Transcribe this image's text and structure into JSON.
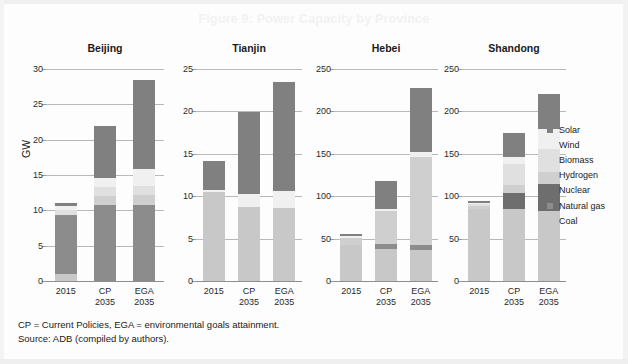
{
  "figure": {
    "title": "Figure 9: Power Capacity by Province",
    "title_color": "#f2f2f2",
    "y_axis_label": "GW"
  },
  "footnote": {
    "line1": "CP = Current Policies, EGA = environmental goals attainment.",
    "line2": "Source: ADB (compiled by authors)."
  },
  "legend": {
    "position": "right",
    "items": [
      {
        "label": "Solar",
        "color": "#808080"
      },
      {
        "label": "Wind",
        "color": "#f0f0f0"
      },
      {
        "label": "Biomass",
        "color": "#e0e0e0"
      },
      {
        "label": "Hydrogen",
        "color": "#cfcfcf"
      },
      {
        "label": "Nuclear",
        "color": "#6e6e6e"
      },
      {
        "label": "Natural gas",
        "color": "#8c8c8c"
      },
      {
        "label": "Coal",
        "color": "#c8c8c8"
      }
    ]
  },
  "chart_data": {
    "type": "bar",
    "title": "Figure 9: Power Capacity by Province",
    "xlabel": "",
    "ylabel": "GW",
    "grid": true,
    "stacked": true,
    "legend_position": "right",
    "series_order_bottom_to_top": [
      "Coal",
      "Natural gas",
      "Nuclear",
      "Hydrogen",
      "Biomass",
      "Wind",
      "Solar"
    ],
    "series_colors": {
      "Coal": "#c8c8c8",
      "Natural gas": "#8c8c8c",
      "Nuclear": "#6e6e6e",
      "Hydrogen": "#cfcfcf",
      "Biomass": "#e0e0e0",
      "Wind": "#f0f0f0",
      "Solar": "#808080"
    },
    "categories": [
      "2015",
      "CP 2035",
      "EGA 2035"
    ],
    "panels": [
      {
        "name": "Beijing",
        "ylim": [
          0,
          30
        ],
        "yticks": [
          0,
          5,
          10,
          15,
          20,
          25,
          30
        ],
        "bars": [
          {
            "category": "2015",
            "total": 11.0,
            "segments": [
              {
                "name": "Coal",
                "value": 1.0
              },
              {
                "name": "Natural gas",
                "value": 8.4
              },
              {
                "name": "Nuclear",
                "value": 0.0
              },
              {
                "name": "Hydrogen",
                "value": 0.0
              },
              {
                "name": "Biomass",
                "value": 0.6
              },
              {
                "name": "Wind",
                "value": 0.6
              },
              {
                "name": "Solar",
                "value": 0.4
              }
            ]
          },
          {
            "category": "CP 2035",
            "total": 21.9,
            "segments": [
              {
                "name": "Coal",
                "value": 0.0
              },
              {
                "name": "Natural gas",
                "value": 10.8
              },
              {
                "name": "Nuclear",
                "value": 0.0
              },
              {
                "name": "Hydrogen",
                "value": 1.3
              },
              {
                "name": "Biomass",
                "value": 1.2
              },
              {
                "name": "Wind",
                "value": 1.3
              },
              {
                "name": "Solar",
                "value": 7.3
              }
            ]
          },
          {
            "category": "EGA 2035",
            "total": 28.4,
            "segments": [
              {
                "name": "Coal",
                "value": 0.0
              },
              {
                "name": "Natural gas",
                "value": 10.8
              },
              {
                "name": "Nuclear",
                "value": 0.0
              },
              {
                "name": "Hydrogen",
                "value": 1.4
              },
              {
                "name": "Biomass",
                "value": 1.3
              },
              {
                "name": "Wind",
                "value": 2.3
              },
              {
                "name": "Solar",
                "value": 12.6
              }
            ]
          }
        ]
      },
      {
        "name": "Tianjin",
        "ylim": [
          0,
          25
        ],
        "yticks": [
          0,
          5,
          10,
          15,
          20,
          25
        ],
        "bars": [
          {
            "category": "2015",
            "total": 14.1,
            "segments": [
              {
                "name": "Coal",
                "value": 10.5
              },
              {
                "name": "Natural gas",
                "value": 0.0
              },
              {
                "name": "Nuclear",
                "value": 0.0
              },
              {
                "name": "Hydrogen",
                "value": 0.0
              },
              {
                "name": "Biomass",
                "value": 0.0
              },
              {
                "name": "Wind",
                "value": 0.2
              },
              {
                "name": "Solar",
                "value": 3.4
              }
            ]
          },
          {
            "category": "CP 2035",
            "total": 19.9,
            "segments": [
              {
                "name": "Coal",
                "value": 8.7
              },
              {
                "name": "Natural gas",
                "value": 0.0
              },
              {
                "name": "Nuclear",
                "value": 0.0
              },
              {
                "name": "Hydrogen",
                "value": 0.0
              },
              {
                "name": "Biomass",
                "value": 0.0
              },
              {
                "name": "Wind",
                "value": 1.6
              },
              {
                "name": "Solar",
                "value": 9.6
              }
            ]
          },
          {
            "category": "EGA 2035",
            "total": 23.5,
            "segments": [
              {
                "name": "Coal",
                "value": 8.6
              },
              {
                "name": "Natural gas",
                "value": 0.0
              },
              {
                "name": "Nuclear",
                "value": 0.0
              },
              {
                "name": "Hydrogen",
                "value": 0.0
              },
              {
                "name": "Biomass",
                "value": 0.0
              },
              {
                "name": "Wind",
                "value": 2.0
              },
              {
                "name": "Solar",
                "value": 12.9
              }
            ]
          }
        ]
      },
      {
        "name": "Hebei",
        "ylim": [
          0,
          250
        ],
        "yticks": [
          0,
          50,
          100,
          150,
          200,
          250
        ],
        "bars": [
          {
            "category": "2015",
            "total": 56,
            "segments": [
              {
                "name": "Coal",
                "value": 43
              },
              {
                "name": "Natural gas",
                "value": 0
              },
              {
                "name": "Nuclear",
                "value": 0
              },
              {
                "name": "Hydrogen",
                "value": 8
              },
              {
                "name": "Biomass",
                "value": 0
              },
              {
                "name": "Wind",
                "value": 2
              },
              {
                "name": "Solar",
                "value": 3
              }
            ]
          },
          {
            "category": "CP 2035",
            "total": 118,
            "segments": [
              {
                "name": "Coal",
                "value": 38
              },
              {
                "name": "Natural gas",
                "value": 6
              },
              {
                "name": "Nuclear",
                "value": 0
              },
              {
                "name": "Hydrogen",
                "value": 38
              },
              {
                "name": "Biomass",
                "value": 0
              },
              {
                "name": "Wind",
                "value": 3
              },
              {
                "name": "Solar",
                "value": 33
              }
            ]
          },
          {
            "category": "EGA 2035",
            "total": 228,
            "segments": [
              {
                "name": "Coal",
                "value": 37
              },
              {
                "name": "Natural gas",
                "value": 6
              },
              {
                "name": "Nuclear",
                "value": 0
              },
              {
                "name": "Hydrogen",
                "value": 103
              },
              {
                "name": "Biomass",
                "value": 0
              },
              {
                "name": "Wind",
                "value": 6
              },
              {
                "name": "Solar",
                "value": 76
              }
            ]
          }
        ]
      },
      {
        "name": "Shandong",
        "ylim": [
          0,
          250
        ],
        "yticks": [
          0,
          50,
          100,
          150,
          200,
          250
        ],
        "bars": [
          {
            "category": "2015",
            "total": 94,
            "segments": [
              {
                "name": "Coal",
                "value": 85
              },
              {
                "name": "Natural gas",
                "value": 0
              },
              {
                "name": "Nuclear",
                "value": 0
              },
              {
                "name": "Hydrogen",
                "value": 4
              },
              {
                "name": "Biomass",
                "value": 2
              },
              {
                "name": "Wind",
                "value": 1
              },
              {
                "name": "Solar",
                "value": 2
              }
            ]
          },
          {
            "category": "CP 2035",
            "total": 175,
            "segments": [
              {
                "name": "Coal",
                "value": 85
              },
              {
                "name": "Natural gas",
                "value": 0
              },
              {
                "name": "Nuclear",
                "value": 19
              },
              {
                "name": "Hydrogen",
                "value": 9
              },
              {
                "name": "Biomass",
                "value": 25
              },
              {
                "name": "Wind",
                "value": 8
              },
              {
                "name": "Solar",
                "value": 29
              }
            ]
          },
          {
            "category": "EGA 2035",
            "total": 220,
            "segments": [
              {
                "name": "Coal",
                "value": 82
              },
              {
                "name": "Natural gas",
                "value": 0
              },
              {
                "name": "Nuclear",
                "value": 32
              },
              {
                "name": "Hydrogen",
                "value": 14
              },
              {
                "name": "Biomass",
                "value": 28
              },
              {
                "name": "Wind",
                "value": 23
              },
              {
                "name": "Solar",
                "value": 41
              }
            ]
          }
        ]
      }
    ]
  }
}
